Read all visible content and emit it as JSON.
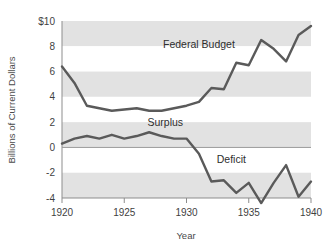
{
  "chart_data": {
    "type": "line",
    "title": "",
    "xlabel": "Year",
    "ylabel": "Billions of Current Dollars",
    "xlim": [
      1920,
      1940
    ],
    "ylim": [
      -4,
      10
    ],
    "grid": "horizontal-bands",
    "legend": "inline-annotations",
    "x": [
      1920,
      1921,
      1922,
      1923,
      1924,
      1925,
      1926,
      1927,
      1928,
      1929,
      1930,
      1931,
      1932,
      1933,
      1934,
      1935,
      1936,
      1937,
      1938,
      1939,
      1940
    ],
    "xticks": [
      "1920",
      "1925",
      "1930",
      "1935",
      "1940"
    ],
    "yticks": [
      "$10",
      "8",
      "6",
      "4",
      "2",
      "0",
      "-2",
      "-4"
    ],
    "ytick_values": [
      10,
      8,
      6,
      4,
      2,
      0,
      -2,
      -4
    ],
    "series": [
      {
        "name": "Federal Budget",
        "color": "#5a5a5a",
        "values": [
          6.4,
          5.1,
          3.3,
          3.1,
          2.9,
          3.0,
          3.1,
          2.9,
          2.9,
          3.1,
          3.3,
          3.6,
          4.7,
          4.6,
          6.7,
          6.5,
          8.5,
          7.8,
          6.8,
          8.9,
          9.6
        ]
      },
      {
        "name": "Surplus/Deficit",
        "color": "#5a5a5a",
        "values": [
          0.3,
          0.7,
          0.9,
          0.7,
          1.0,
          0.7,
          0.9,
          1.2,
          0.9,
          0.7,
          0.7,
          -0.5,
          -2.7,
          -2.6,
          -3.6,
          -2.8,
          -4.4,
          -2.8,
          -1.4,
          -3.9,
          -2.7
        ]
      }
    ],
    "annotations": [
      {
        "text": "Federal Budget",
        "x": 1931.0,
        "y": 7.9
      },
      {
        "text": "Surplus",
        "x": 1928.3,
        "y": 1.7
      },
      {
        "text": "Deficit",
        "x": 1933.6,
        "y": -1.2
      }
    ],
    "zero_line": 0,
    "band_color": "#e2e2e2",
    "band_alt_color": "#ffffff"
  },
  "axis": {
    "ylabel": "Billions of Current Dollars",
    "xlabel": "Year"
  }
}
